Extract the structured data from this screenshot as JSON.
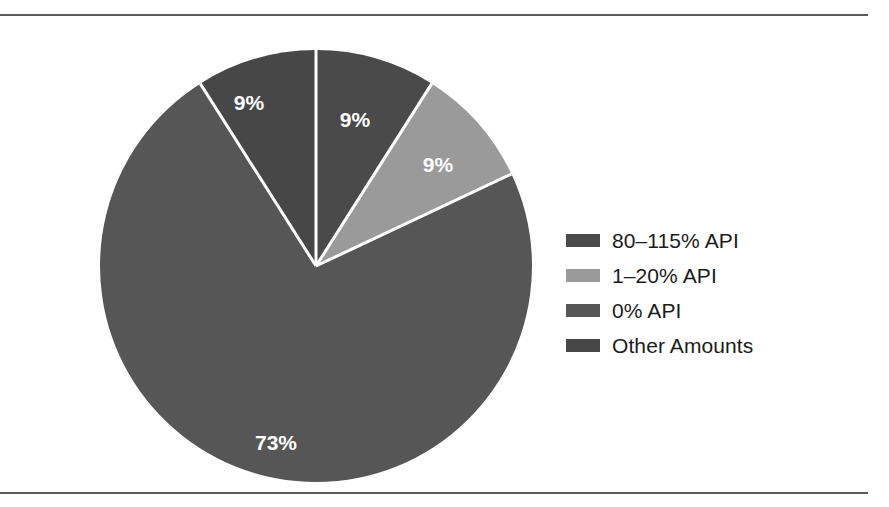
{
  "figure": {
    "rule_color": "#595959",
    "background": "#ffffff"
  },
  "chart_data": {
    "type": "pie",
    "title": "",
    "subtitle": "",
    "xlabel": "",
    "ylabel": "",
    "grid": false,
    "legend_position": "right",
    "start_angle_deg": 0,
    "direction": "clockwise",
    "center": {
      "x": 316,
      "y": 257
    },
    "radius": 210,
    "separator_color": "#ffffff",
    "separator_width": 3,
    "labels_inside": true,
    "label_color": "#ffffff",
    "categories": [
      "80–115% API",
      "1–20% API",
      "0% API",
      "Other Amounts"
    ],
    "values": [
      9,
      9,
      73,
      9
    ],
    "value_labels": [
      "9%",
      "9%",
      "73%",
      "9%"
    ],
    "colors": [
      "#4a4a4a",
      "#9a9a9a",
      "#565656",
      "#474747"
    ],
    "slices": [
      {
        "label": "80–115% API",
        "value": 9,
        "value_label": "9%",
        "color": "#4a4a4a",
        "start_deg": 0,
        "end_deg": 32.4,
        "label_x": 355,
        "label_y": 107
      },
      {
        "label": "1–20% API",
        "value": 9,
        "value_label": "9%",
        "color": "#9a9a9a",
        "start_deg": 32.4,
        "end_deg": 64.8,
        "label_x": 438,
        "label_y": 152
      },
      {
        "label": "0% API",
        "value": 73,
        "value_label": "73%",
        "color": "#565656",
        "start_deg": 64.8,
        "end_deg": 327.6,
        "label_x": 276,
        "label_y": 430
      },
      {
        "label": "Other Amounts",
        "value": 9,
        "value_label": "9%",
        "color": "#474747",
        "start_deg": 327.6,
        "end_deg": 360,
        "label_x": 249,
        "label_y": 90
      }
    ]
  },
  "legend": {
    "items": [
      {
        "label": "80–115% API",
        "color": "#4a4a4a"
      },
      {
        "label": "1–20% API",
        "color": "#9a9a9a"
      },
      {
        "label": "0% API",
        "color": "#565656"
      },
      {
        "label": "Other Amounts",
        "color": "#474747"
      }
    ]
  }
}
